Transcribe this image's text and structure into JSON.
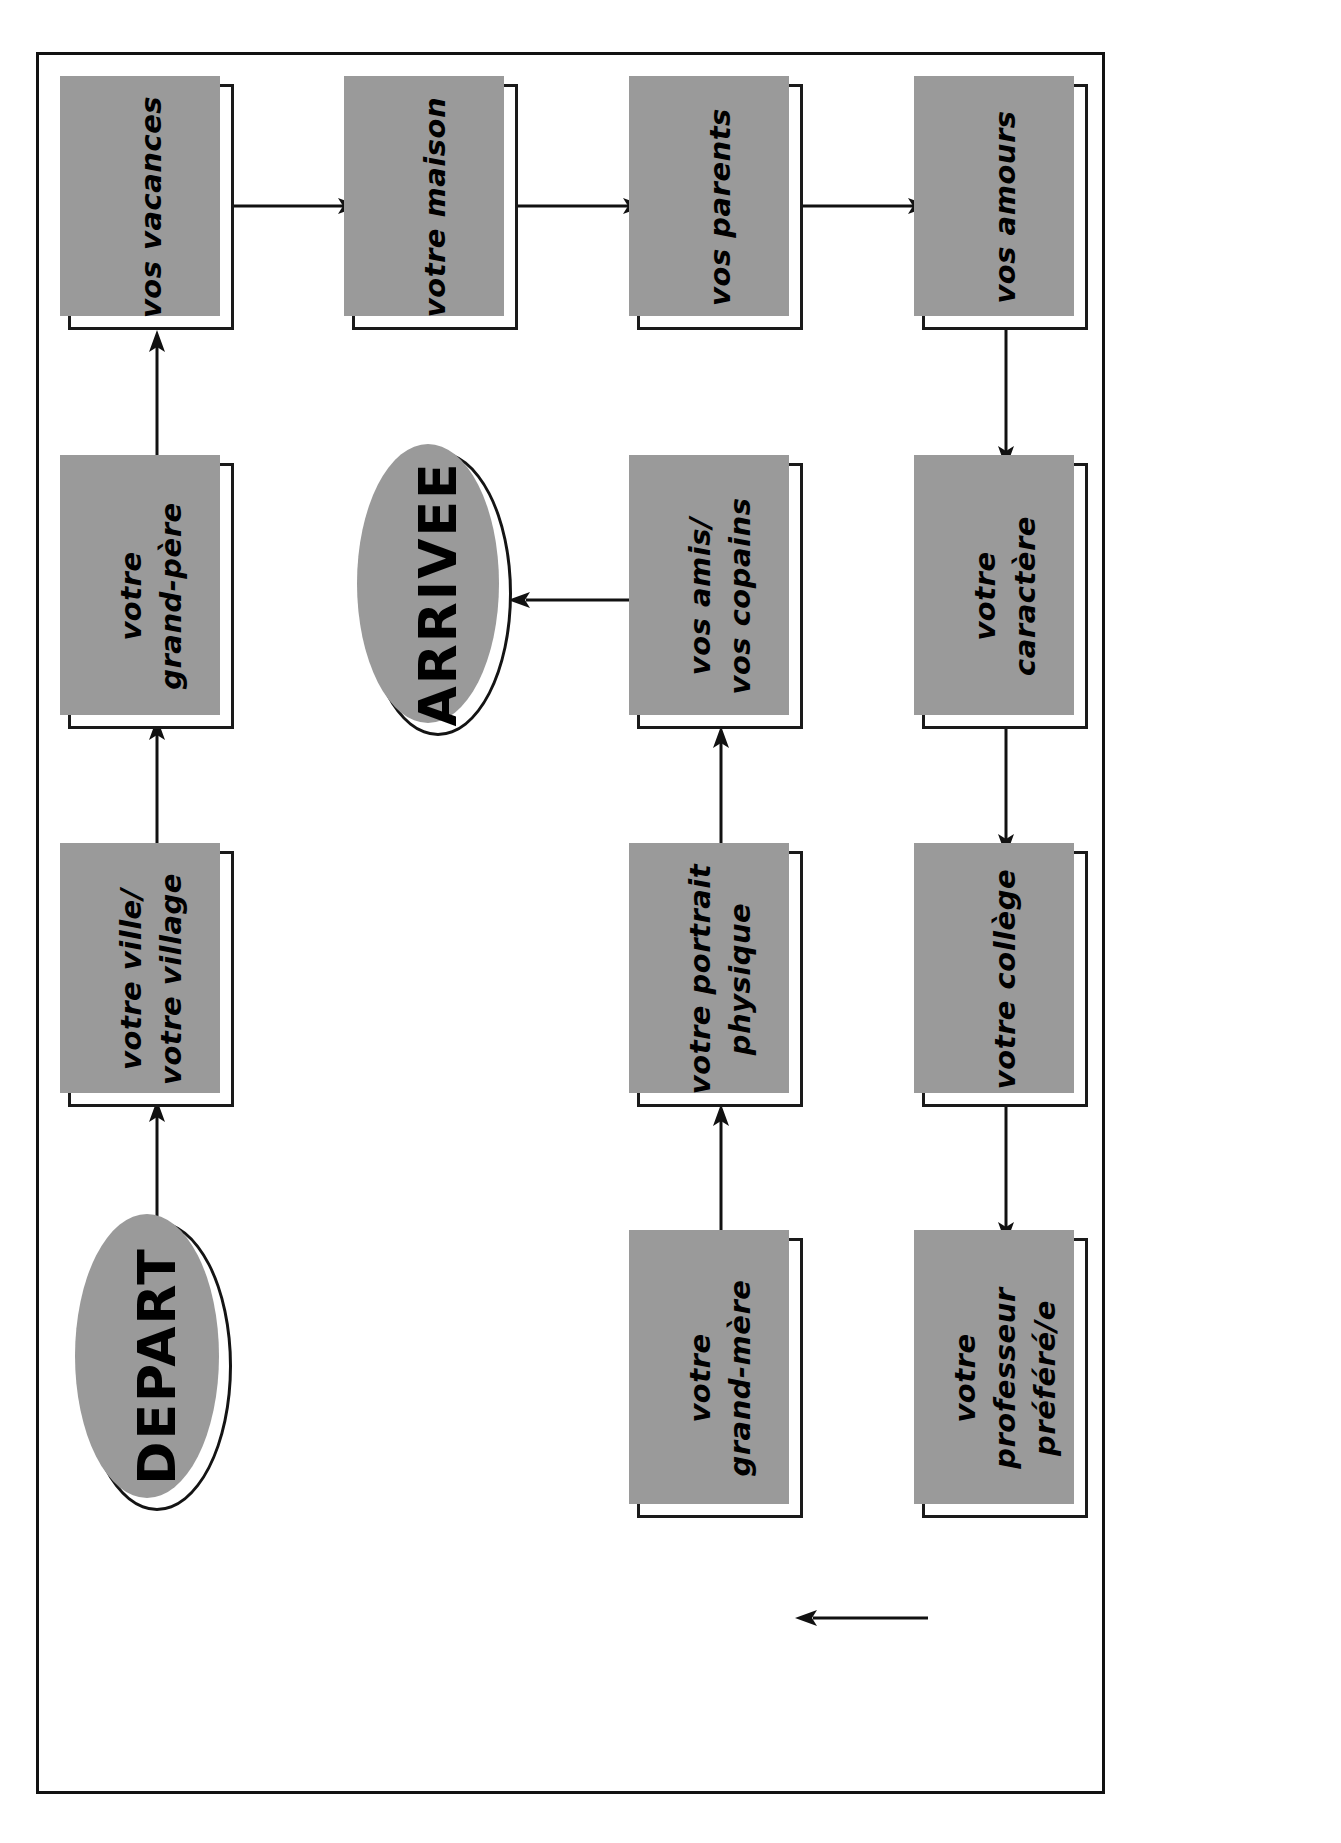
{
  "diagram": {
    "orientation": "rotated-90-ccw",
    "frame_label": "sheet-border",
    "colors": {
      "stroke": "#111111",
      "box_fill": "#ffffff",
      "shadow": "#9a9a9a",
      "text": "#000000",
      "page": "#ffffff"
    },
    "terminals": [
      {
        "id": "depart",
        "label": "DEPART"
      },
      {
        "id": "arrivee",
        "label": "ARRIVEE"
      }
    ],
    "nodes": [
      {
        "id": "ville",
        "label": "votre ville/\nvotre village"
      },
      {
        "id": "grandpere",
        "label": "votre\ngrand-père"
      },
      {
        "id": "vacances",
        "label": "vos vacances"
      },
      {
        "id": "maison",
        "label": "votre maison"
      },
      {
        "id": "parents",
        "label": "vos parents"
      },
      {
        "id": "amours",
        "label": "vos amours"
      },
      {
        "id": "caractere",
        "label": "votre\ncaractère"
      },
      {
        "id": "college",
        "label": "votre collège"
      },
      {
        "id": "professeur",
        "label": "votre\nprofesseur\npréféré/e"
      },
      {
        "id": "grandmere",
        "label": "votre\ngrand-mère"
      },
      {
        "id": "portrait",
        "label": "votre portrait\nphysique"
      },
      {
        "id": "amis",
        "label": "vos amis/\nvos copains"
      }
    ],
    "edges": [
      {
        "from": "depart",
        "to": "ville"
      },
      {
        "from": "ville",
        "to": "grandpere"
      },
      {
        "from": "grandpere",
        "to": "vacances"
      },
      {
        "from": "vacances",
        "to": "maison"
      },
      {
        "from": "maison",
        "to": "parents"
      },
      {
        "from": "parents",
        "to": "amours"
      },
      {
        "from": "amours",
        "to": "caractere"
      },
      {
        "from": "caractere",
        "to": "college"
      },
      {
        "from": "college",
        "to": "professeur"
      },
      {
        "from": "professeur",
        "to": "grandmere"
      },
      {
        "from": "grandmere",
        "to": "portrait"
      },
      {
        "from": "portrait",
        "to": "amis"
      },
      {
        "from": "amis",
        "to": "arrivee"
      }
    ]
  }
}
